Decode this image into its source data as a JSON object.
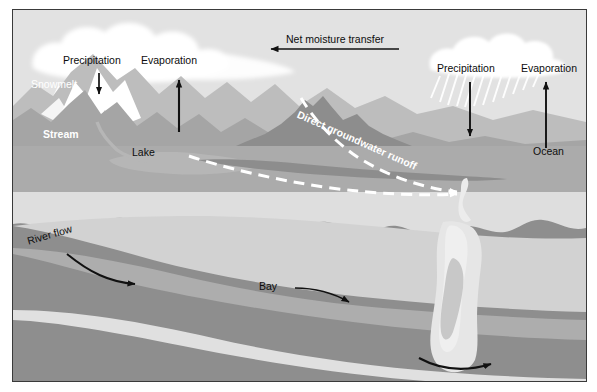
{
  "figure": {
    "type": "cross-section-diagram",
    "frame": {
      "border_color": "#3a3a3a",
      "background_color": "#e2e2e2"
    }
  },
  "labels": {
    "precipitation_land": "Precipitation",
    "evaporation_land": "Evaporation",
    "snowmelt": "Snowmelt",
    "stream": "Stream",
    "lake": "Lake",
    "net_moisture_transfer": "Net moisture transfer",
    "direct_groundwater_runoff": "Direct groundwater runoff",
    "precipitation_ocean": "Precipitation",
    "evaporation_ocean": "Evaporation",
    "ocean": "Ocean",
    "river_flow": "River flow",
    "bay": "Bay"
  },
  "icons": {
    "cloud_left": "cloud-icon",
    "cloud_right": "rain-cloud-icon",
    "rain_streaks_left": "rain-streaks-icon",
    "rain_streaks_right": "rain-streaks-icon",
    "arrow_precip_land": "arrow-down-icon",
    "arrow_evap_land": "arrow-up-icon",
    "arrow_net_transfer": "arrow-left-icon",
    "arrow_precip_ocean": "arrow-down-icon",
    "arrow_evap_ocean": "arrow-up-icon",
    "arrow_river_flow": "curved-arrow-right-icon",
    "arrow_bay": "curved-arrow-right-icon",
    "arrow_outflow": "curved-arrow-right-icon",
    "arrow_groundwater": "dashed-arrow-right-icon"
  },
  "palette": {
    "sky": "#e2e2e2",
    "cloud": "#ffffff",
    "mountain_far": "#b9b9b9",
    "mountain_mid": "#a2a2a2",
    "mountain_near": "#8d8d8d",
    "water_surface": "#ababab",
    "lake": "#b4b4b4",
    "snow": "#ffffff",
    "subsurface_upper": "#8e8e8e",
    "subsurface_light": "#d9d9d9",
    "subsurface_mid": "#b2b2b2",
    "subsurface_pale": "#e3e3e3",
    "channel": "#e8e8e8",
    "arrow": "#111111",
    "dashed_line": "#ffffff"
  },
  "flows": [
    {
      "name": "net-moisture-transfer",
      "direction": "ocean-to-land",
      "region": "atmosphere"
    },
    {
      "name": "precipitation",
      "direction": "down",
      "region": "land"
    },
    {
      "name": "evaporation",
      "direction": "up",
      "region": "land"
    },
    {
      "name": "precipitation",
      "direction": "down",
      "region": "ocean"
    },
    {
      "name": "evaporation",
      "direction": "up",
      "region": "ocean"
    },
    {
      "name": "snowmelt",
      "direction": "downslope",
      "region": "land"
    },
    {
      "name": "direct-groundwater-runoff",
      "direction": "toward-ocean",
      "region": "subsurface"
    },
    {
      "name": "river-flow",
      "direction": "toward-bay",
      "region": "subsurface"
    },
    {
      "name": "bay-outflow",
      "direction": "toward-ocean",
      "region": "subsurface"
    }
  ]
}
